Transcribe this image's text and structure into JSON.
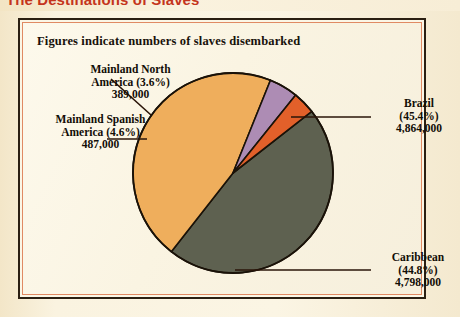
{
  "page": {
    "title": "The Destinations of Slaves",
    "caption": "Figures indicate numbers of slaves disembarked"
  },
  "colors": {
    "title": "#c4341c",
    "paper": "#faf3e0",
    "frame_outer": "#2a1f12",
    "frame_inner": "#e08a63",
    "brazil": "#5e6150",
    "caribbean": "#efae5c",
    "spanish": "#ad8cb4",
    "north_america": "#e2602a",
    "outline": "#1a1208",
    "leader": "#2a1408"
  },
  "labels": {
    "north_america": {
      "line1": "Mainland North",
      "line2": "America (3.6%)",
      "line3": "389,000"
    },
    "spanish_america": {
      "line1": "Mainland Spanish",
      "line2": "America (4.6%)",
      "line3": "487,000"
    },
    "brazil": {
      "line1": "Brazil",
      "line2": "(45.4%)",
      "line3": "4,864,000"
    },
    "caribbean": {
      "line1": "Caribbean",
      "line2": "(44.8%)",
      "line3": "4,798,000"
    }
  },
  "chart_data": {
    "type": "pie",
    "title": "The Destinations of Slaves",
    "subtitle": "Figures indicate numbers of slaves disembarked",
    "unit": "slaves disembarked",
    "total": 10538000,
    "legend": "labels-with-leader-lines",
    "categories": [
      "Brazil",
      "Caribbean",
      "Mainland Spanish America",
      "Mainland North America"
    ],
    "values": [
      4864000,
      4798000,
      487000,
      389000
    ],
    "percentages": [
      45.4,
      44.8,
      4.6,
      3.6
    ],
    "colors": [
      "#5e6150",
      "#efae5c",
      "#ad8cb4",
      "#e2602a"
    ],
    "slices": [
      {
        "name": "Brazil",
        "value": 4864000,
        "percent": 45.4,
        "color": "#5e6150",
        "label": "Brazil (45.4%) 4,864,000"
      },
      {
        "name": "Caribbean",
        "value": 4798000,
        "percent": 44.8,
        "color": "#efae5c",
        "label": "Caribbean (44.8%) 4,798,000"
      },
      {
        "name": "Mainland Spanish America",
        "value": 487000,
        "percent": 4.6,
        "color": "#ad8cb4",
        "label": "Mainland Spanish America (4.6%) 487,000"
      },
      {
        "name": "Mainland North America",
        "value": 389000,
        "percent": 3.6,
        "color": "#e2602a",
        "label": "Mainland North America (3.6%) 389,000"
      }
    ],
    "start_angle_deg": -38,
    "direction": "clockwise",
    "grid": false
  }
}
